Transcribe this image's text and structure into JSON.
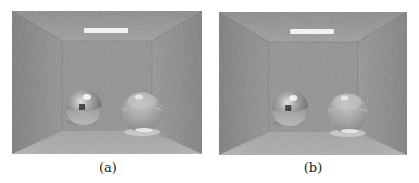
{
  "figure": {
    "panels": [
      {
        "id": "a",
        "caption": "(a)",
        "description": "Rendered Cornell box scene with mirror sphere (left) and glass sphere (right), area light on ceiling"
      },
      {
        "id": "b",
        "caption": "(b)",
        "description": "Rendered Cornell box scene with mirror sphere (left) and glass sphere (right), area light on ceiling"
      }
    ]
  }
}
